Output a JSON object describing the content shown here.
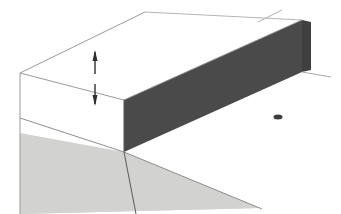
{
  "figure": {
    "canvas": {
      "width": 341,
      "height": 214,
      "background": "#ffffff"
    },
    "colors": {
      "background": "#ffffff",
      "top_face_fill": "#ffffff",
      "slab_dark_fill": "#4a4a4a",
      "ground_gray_fill": "#d2d2d0",
      "outline_light": "#b9b9b9",
      "outline_medium": "#8e8e8e",
      "outline_dark": "#555555",
      "arrow_color": "#2e2e2e"
    },
    "shapes": {
      "top_face": {
        "name": "upper-white-face",
        "points": "20,73 145,12 302,20 124,100"
      },
      "left_white_face": {
        "name": "left-white-side-face",
        "points": "20,73 124,100 124,152 20,133"
      },
      "dark_slab_front": {
        "name": "dark-slab-front-face",
        "points": "124,100 302,20 302,72 124,152"
      },
      "dark_slab_end": {
        "name": "dark-slab-right-end-face",
        "points": "302,20 311,22 311,70 302,72"
      },
      "ground_gray": {
        "name": "gray-ground-plane",
        "points": "20,118 20,214 260,208"
      },
      "ground_gray_upper": {
        "name": "gray-ground-upper-wedge",
        "points": "20,118 124,152 260,208 20,214"
      }
    },
    "lines": [
      {
        "name": "top-left-ridge-line",
        "x1": 20,
        "y1": 73,
        "x2": 145,
        "y2": 12,
        "color": "#9a9a9a",
        "width": 1
      },
      {
        "name": "top-back-ridge-line",
        "x1": 145,
        "y1": 12,
        "x2": 302,
        "y2": 20,
        "color": "#b4b4b4",
        "width": 1
      },
      {
        "name": "top-front-edge-line",
        "x1": 20,
        "y1": 73,
        "x2": 124,
        "y2": 100,
        "color": "#9a9a9a",
        "width": 1
      },
      {
        "name": "top-face-right-edge-line",
        "x1": 124,
        "y1": 100,
        "x2": 302,
        "y2": 20,
        "color": "#8e8e8e",
        "width": 1
      },
      {
        "name": "left-vertical-edge-line",
        "x1": 20,
        "y1": 73,
        "x2": 20,
        "y2": 214,
        "color": "#9a9a9a",
        "width": 1
      },
      {
        "name": "slab-left-vertical-edge-line",
        "x1": 124,
        "y1": 100,
        "x2": 124,
        "y2": 152,
        "color": "#555555",
        "width": 1
      },
      {
        "name": "right-extension-line",
        "x1": 302,
        "y1": 72,
        "x2": 331,
        "y2": 77,
        "color": "#a8a8a8",
        "width": 1
      },
      {
        "name": "upper-right-extension-line",
        "x1": 258,
        "y1": 22,
        "x2": 282,
        "y2": 10,
        "color": "#b0b0b0",
        "width": 1
      },
      {
        "name": "ground-slope-line",
        "x1": 20,
        "y1": 118,
        "x2": 124,
        "y2": 152,
        "color": "#8e8e8e",
        "width": 1
      },
      {
        "name": "ground-far-slope-line",
        "x1": 124,
        "y1": 152,
        "x2": 262,
        "y2": 209,
        "color": "#8e8e8e",
        "width": 1
      },
      {
        "name": "fault-descent-line",
        "x1": 124,
        "y1": 152,
        "x2": 136,
        "y2": 214,
        "color": "#5a5a5a",
        "width": 1
      }
    ],
    "dimension": {
      "name": "height-dimension-arrows",
      "x": 95,
      "top_y": 50,
      "bottom_y": 106,
      "gap_top": 74,
      "gap_bottom": 84,
      "arrow_color": "#2e2e2e",
      "shaft_width": 1.4,
      "head_width": 5,
      "head_length": 11,
      "label": ""
    },
    "marker": {
      "name": "small-dark-marker",
      "x": 278,
      "y": 117,
      "width": 9,
      "height": 5,
      "color": "#3c3c3c"
    }
  }
}
